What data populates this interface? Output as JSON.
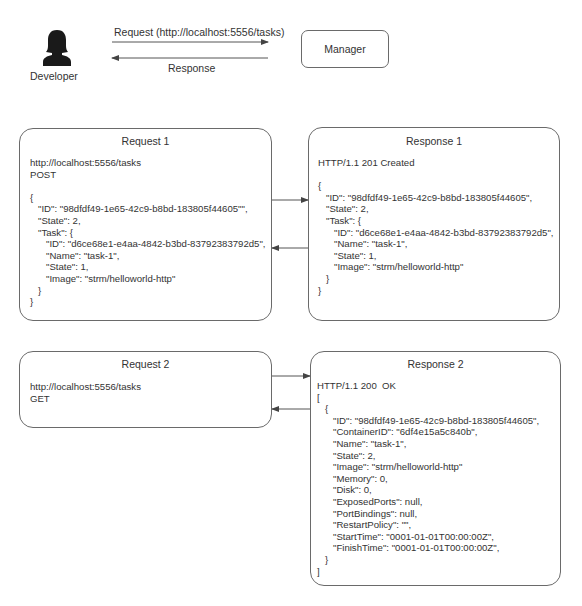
{
  "top": {
    "actor_label": "Developer",
    "manager_label": "Manager",
    "request_arrow_label": "Request (http://localhost:5556/tasks)",
    "response_arrow_label": "Response"
  },
  "request1": {
    "title": "Request 1",
    "body": "http://localhost:5556/tasks\nPOST\n\n{\n   \"ID\": \"98dfdf49-1e65-42c9-b8bd-183805f44605\"\",\n   \"State\": 2,\n   \"Task\": {\n      \"ID\": \"d6ce68e1-e4aa-4842-b3bd-83792383792d5\",\n      \"Name\": \"task-1\",\n      \"State\": 1,\n      \"Image\": \"strm/helloworld-http\"\n   }\n}"
  },
  "response1": {
    "title": "Response 1",
    "body": "HTTP/1.1 201 Created\n\n{\n   \"ID\": \"98dfdf49-1e65-42c9-b8bd-183805f44605\",\n   \"State\": 2,\n   \"Task\": {\n      \"ID\": \"d6ce68e1-e4aa-4842-b3bd-83792383792d5\",\n      \"Name\": \"task-1\",\n      \"State\": 1,\n      \"Image\": \"strm/helloworld-http\"\n   }\n}"
  },
  "request2": {
    "title": "Request 2",
    "body": "http://localhost:5556/tasks\nGET"
  },
  "response2": {
    "title": "Response 2",
    "body": "HTTP/1.1 200  OK\n[\n   {\n      \"ID\": \"98dfdf49-1e65-42c9-b8bd-183805f44605\",\n      \"ContainerID\": \"6df4e15a5c840b\",\n      \"Name\": \"task-1\",\n      \"State\": 2,\n      \"Image\": \"strm/helloworld-http\"\n      \"Memory\": 0,\n      \"Disk\": 0,\n      \"ExposedPorts\": null,\n      \"PortBindings\": null,\n      \"RestartPolicy\": \"\",\n      \"StartTime\": \"0001-01-01T00:00:00Z\",\n      \"FinishTime\": \"0001-01-01T00:00:00Z\",\n   }\n]"
  },
  "colors": {
    "stroke": "#6a6a6a",
    "text": "#333333",
    "actor": "#1a1a1a"
  }
}
